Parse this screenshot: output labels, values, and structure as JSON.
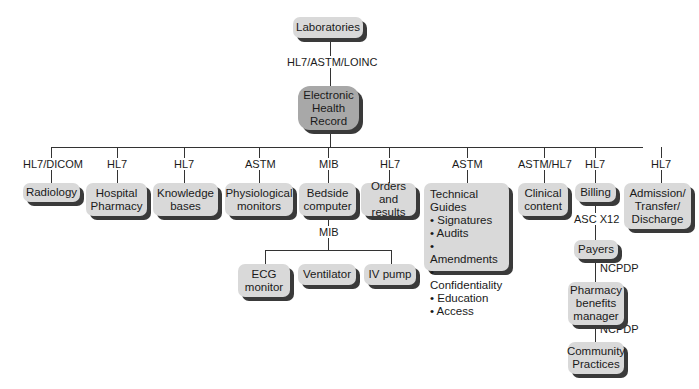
{
  "diagram": {
    "top": {
      "label": "Laboratories",
      "link": "HL7/ASTM/LOINC"
    },
    "center": {
      "label": "Electronic Health Record",
      "lines": [
        "Electronic",
        "Health",
        "Record"
      ]
    },
    "branches": [
      {
        "id": "radiology",
        "standard": "HL7/DICOM",
        "lines": [
          "Radiology"
        ]
      },
      {
        "id": "hospital-pharmacy",
        "standard": "HL7",
        "lines": [
          "Hospital",
          "Pharmacy"
        ]
      },
      {
        "id": "knowledge-bases",
        "standard": "HL7",
        "lines": [
          "Knowledge",
          "bases"
        ]
      },
      {
        "id": "physiological-monitors",
        "standard": "ASTM",
        "lines": [
          "Physiological",
          "monitors"
        ]
      },
      {
        "id": "bedside-computer",
        "standard": "MIB",
        "lines": [
          "Bedside",
          "computer"
        ]
      },
      {
        "id": "orders-results",
        "standard": "HL7",
        "lines": [
          "Orders",
          "and results"
        ]
      },
      {
        "id": "technical-guides",
        "standard": "ASTM",
        "title": "Technical Guides",
        "items": [
          "Signatures",
          "Audits",
          "Amendments",
          "Confidentiality",
          "Education",
          "Access"
        ]
      },
      {
        "id": "clinical-content",
        "standard": "ASTM/HL7",
        "lines": [
          "Clinical",
          "content"
        ]
      },
      {
        "id": "billing",
        "standard": "HL7",
        "lines": [
          "Billing"
        ]
      },
      {
        "id": "admission",
        "standard": "HL7",
        "lines": [
          "Admission/",
          "Transfer/",
          "Discharge"
        ]
      }
    ],
    "bedside_children": {
      "link": "MIB",
      "items": [
        {
          "lines": [
            "ECG",
            "monitor"
          ]
        },
        {
          "lines": [
            "Ventilator"
          ]
        },
        {
          "lines": [
            "IV pump"
          ]
        }
      ]
    },
    "billing_chain": [
      {
        "link": "ASC X12",
        "lines": [
          "Payers"
        ]
      },
      {
        "link": "NCPDP",
        "lines": [
          "Pharmacy",
          "benefits",
          "manager"
        ]
      },
      {
        "link": "NCPDP",
        "lines": [
          "Community",
          "Practices"
        ]
      }
    ]
  }
}
